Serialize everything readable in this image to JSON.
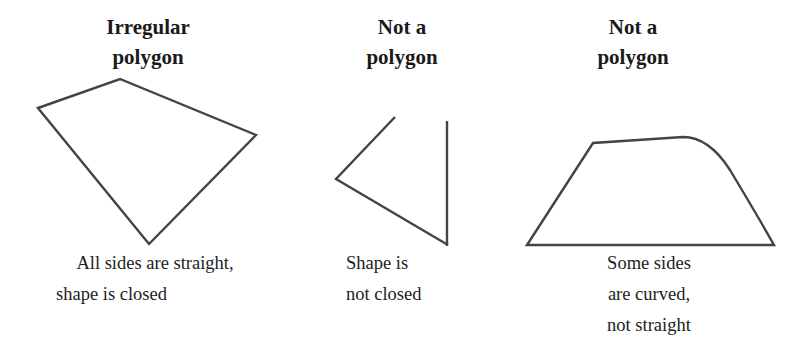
{
  "panels": [
    {
      "title_line1": "Irregular",
      "title_line2": "polygon",
      "caption_line1": "All sides are straight,",
      "caption_line2": "shape is closed",
      "shape": "closed-quadrilateral"
    },
    {
      "title_line1": "Not a",
      "title_line2": "polygon",
      "caption_line1": "Shape is",
      "caption_line2": "not closed",
      "shape": "open-triangle"
    },
    {
      "title_line1": "Not a",
      "title_line2": "polygon",
      "caption_line1": "Some sides",
      "caption_line2": "are curved,",
      "caption_line3": "not straight",
      "shape": "curved-trapezoid"
    }
  ],
  "colors": {
    "stroke": "#444444",
    "text": "#1a1a1a",
    "background": "#ffffff"
  }
}
